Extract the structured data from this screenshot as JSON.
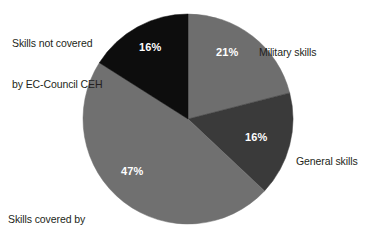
{
  "chart_data": {
    "type": "pie",
    "title": "",
    "subtitle": "",
    "xlabel": "",
    "ylabel": "",
    "legend_position": "outside-callout-labels",
    "grid": false,
    "unit": "%",
    "start_angle_deg": 0,
    "direction": "clockwise",
    "categories": [
      "Military skills",
      "General skills",
      "Skills covered by\nEC-Council CEH",
      "Skills not covered\nby EC-Council CEH"
    ],
    "values": [
      21,
      16,
      47,
      16
    ],
    "slices": [
      {
        "label": "Military skills",
        "label_line1": "Military skills",
        "label_line2": "",
        "value": 21,
        "value_text": "21%",
        "color": "#6e6e6e",
        "label_position": "top-right"
      },
      {
        "label": "General skills",
        "label_line1": "General skills",
        "label_line2": "",
        "value": 16,
        "value_text": "16%",
        "color": "#3a3a3a",
        "label_position": "right"
      },
      {
        "label": "Skills covered by EC-Council CEH",
        "label_line1": "Skills covered by",
        "label_line2": "EC-Council CEH",
        "value": 47,
        "value_text": "47%",
        "color": "#707070",
        "label_position": "bottom-left"
      },
      {
        "label": "Skills not covered by EC-Council CEH",
        "label_line1": "Skills not covered",
        "label_line2": "by EC-Council CEH",
        "value": 16,
        "value_text": "16%",
        "color": "#0d0d0d",
        "label_position": "top-left"
      }
    ],
    "geometry": {
      "center_x": 188,
      "center_y": 119,
      "radius": 105
    },
    "colors": {
      "background": "#ffffff",
      "label_text": "#231f20",
      "value_text": "#ffffff"
    }
  }
}
